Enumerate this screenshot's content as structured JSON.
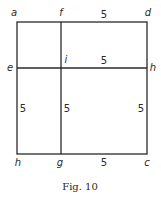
{
  "figure": {
    "caption": "Fig. 10",
    "points": {
      "a": "a",
      "f": "f",
      "d": "d",
      "e": "e",
      "i": "i",
      "h_right": "h",
      "h_bottom": "h",
      "g": "g",
      "c": "c"
    },
    "lengths": {
      "fd": "5",
      "ih": "5",
      "left_side": "5",
      "ig": "5",
      "right_side": "5",
      "gc": "5"
    },
    "line_color": "#2a2a2a"
  }
}
